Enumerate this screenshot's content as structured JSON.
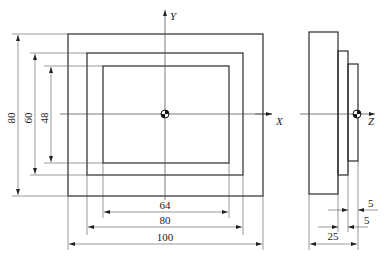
{
  "drawing": {
    "front_view": {
      "rects": [
        {
          "name": "outer",
          "width": 100,
          "height": 80
        },
        {
          "name": "middle",
          "width": 80,
          "height": 60
        },
        {
          "name": "inner",
          "width": 64,
          "height": 48
        }
      ],
      "axes": {
        "horizontal": "X",
        "vertical": "Y"
      },
      "dimensions": {
        "vertical": [
          "80",
          "60",
          "48"
        ],
        "horizontal": [
          "64",
          "80",
          "100"
        ]
      }
    },
    "side_view": {
      "axis": "Z",
      "dimensions": [
        "5",
        "5",
        "25"
      ]
    }
  }
}
